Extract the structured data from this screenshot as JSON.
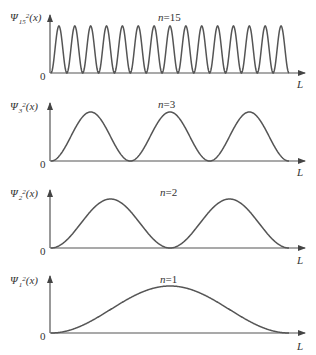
{
  "chart_data": [
    {
      "type": "line",
      "title": "n=15",
      "n": 15,
      "ylabel_base": "Ψ",
      "ylabel_sub": "15",
      "ylabel_sup": "2",
      "ylabel_arg": "(x)",
      "xlabel": "L",
      "origin_label": "0",
      "function": "sin^2(15*pi*x/L)",
      "xlim": [
        0,
        "L"
      ],
      "peaks": 15,
      "nodes_interior": 14
    },
    {
      "type": "line",
      "title": "n=3",
      "n": 3,
      "ylabel_base": "Ψ",
      "ylabel_sub": "3",
      "ylabel_sup": "2",
      "ylabel_arg": "(x)",
      "xlabel": "L",
      "origin_label": "0",
      "function": "sin^2(3*pi*x/L)",
      "xlim": [
        0,
        "L"
      ],
      "peaks": 3,
      "nodes_interior": 2
    },
    {
      "type": "line",
      "title": "n=2",
      "n": 2,
      "ylabel_base": "Ψ",
      "ylabel_sub": "2",
      "ylabel_sup": "2",
      "ylabel_arg": "(x)",
      "xlabel": "L",
      "origin_label": "0",
      "function": "sin^2(2*pi*x/L)",
      "xlim": [
        0,
        "L"
      ],
      "peaks": 2,
      "nodes_interior": 1
    },
    {
      "type": "line",
      "title": "n=1",
      "n": 1,
      "ylabel_base": "Ψ",
      "ylabel_sub": "1",
      "ylabel_sup": "2",
      "ylabel_arg": "(x)",
      "xlabel": "L",
      "origin_label": "0",
      "function": "sin^2(pi*x/L)",
      "xlim": [
        0,
        "L"
      ],
      "peaks": 1,
      "nodes_interior": 0
    }
  ],
  "style": {
    "curve_color": "#555555",
    "axis_color": "#555555"
  }
}
